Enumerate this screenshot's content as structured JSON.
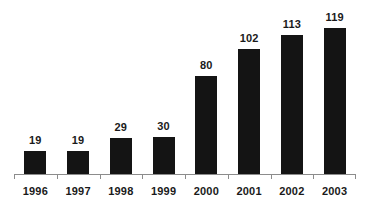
{
  "chart_data": {
    "type": "bar",
    "title": "",
    "subtitle": "",
    "xlabel": "",
    "ylabel": "",
    "categories": [
      "1996",
      "1997",
      "1998",
      "1999",
      "2000",
      "2001",
      "2002",
      "2003"
    ],
    "values": [
      19,
      19,
      29,
      30,
      80,
      102,
      113,
      119
    ],
    "value_labels": [
      "19",
      "19",
      "29",
      "30",
      "80",
      "102",
      "113",
      "119"
    ],
    "ylim": [
      0,
      135
    ],
    "grid": false,
    "legend": null,
    "legend_position": "none",
    "annotations": [],
    "bar_color": "#141414",
    "axis_color": "#8c8c8c",
    "label_color": "#1a1a1a",
    "background_color": "#ffffff",
    "value_labels_shown": true,
    "y_axis_shown": false,
    "x_axis_shown": true
  }
}
